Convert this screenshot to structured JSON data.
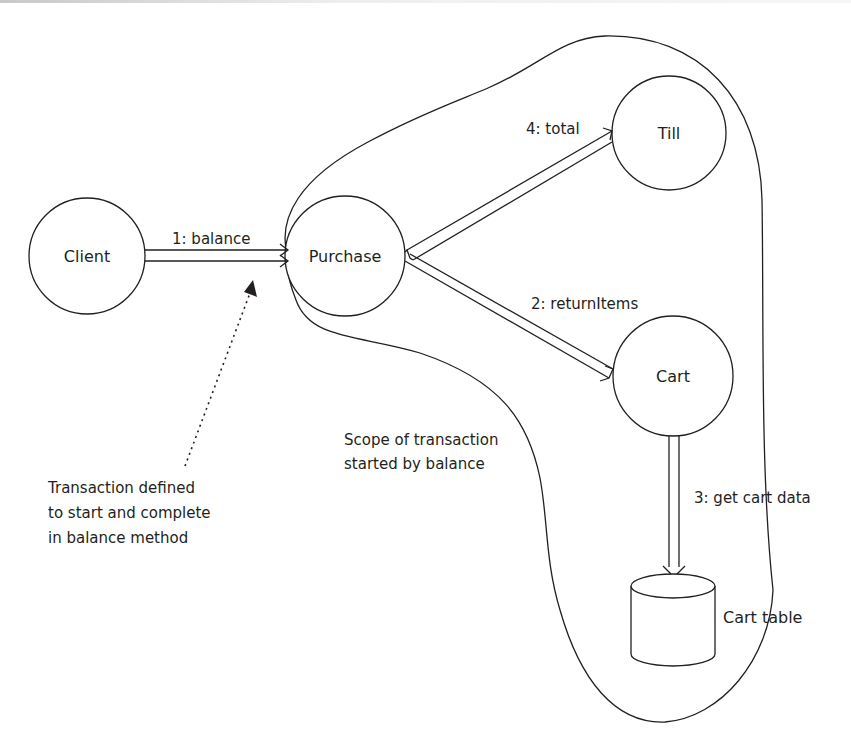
{
  "diagram": {
    "type": "collaboration-diagram",
    "nodes": [
      {
        "id": "client",
        "label": "Client"
      },
      {
        "id": "purchase",
        "label": "Purchase"
      },
      {
        "id": "till",
        "label": "Till"
      },
      {
        "id": "cart",
        "label": "Cart"
      },
      {
        "id": "cart_table",
        "label": "Cart table",
        "shape": "database-cylinder"
      }
    ],
    "messages": [
      {
        "from": "client",
        "to": "purchase",
        "label": "1: balance"
      },
      {
        "from": "purchase",
        "to": "cart",
        "label": "2: returnItems"
      },
      {
        "from": "cart",
        "to": "cart_table",
        "label": "3: get cart data"
      },
      {
        "from": "purchase",
        "to": "till",
        "label": "4: total"
      }
    ],
    "scope": {
      "label_line1": "Scope of transaction",
      "label_line2": "started by balance"
    },
    "annotation": {
      "line1": "Transaction defined",
      "line2": "to start and complete",
      "line3": "in balance method"
    }
  }
}
